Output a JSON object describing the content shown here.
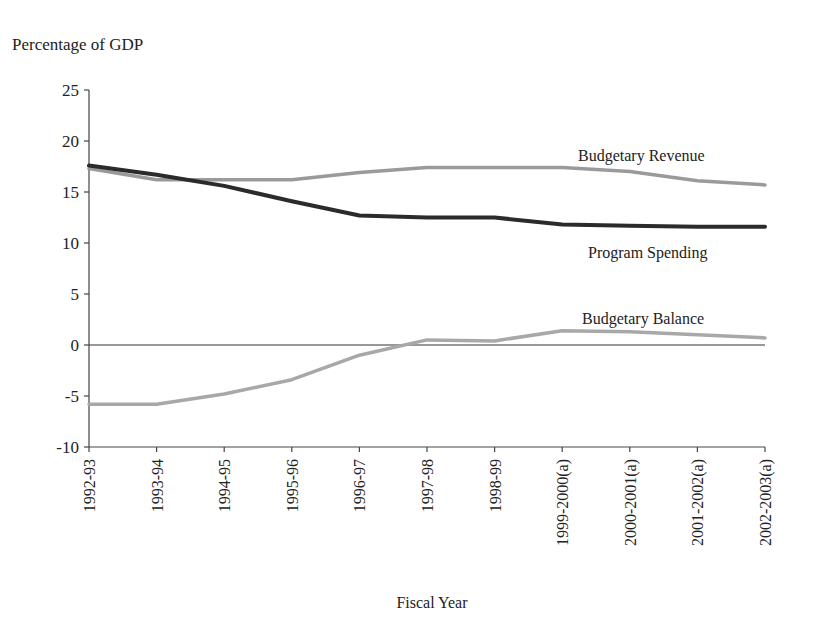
{
  "chart_data": {
    "type": "line",
    "title": "",
    "ylabel": "Percentage of GDP",
    "xlabel": "Fiscal Year",
    "ylim": [
      -10,
      25
    ],
    "yticks": [
      25,
      20,
      15,
      10,
      5,
      0,
      -5,
      -10
    ],
    "grid": false,
    "legend_position": "inline labels",
    "categories": [
      "1992-93",
      "1993-94",
      "1994-95",
      "1995-96",
      "1996-97",
      "1997-98",
      "1998-99",
      "1999-2000(a)",
      "2000-2001(a)",
      "2001-2002(a)",
      "2002-2003(a)"
    ],
    "series": [
      {
        "name": "Budgetary Revenue",
        "color": "#9a9a9a",
        "values": [
          17.3,
          16.2,
          16.2,
          16.2,
          16.9,
          17.4,
          17.4,
          17.4,
          17.0,
          16.1,
          15.7
        ]
      },
      {
        "name": "Program Spending",
        "color": "#2b2b2b",
        "values": [
          17.6,
          16.7,
          15.6,
          14.1,
          12.7,
          12.5,
          12.5,
          11.8,
          11.7,
          11.6,
          11.6
        ]
      },
      {
        "name": "Budgetary Balance",
        "color": "#a8a8a8",
        "values": [
          -5.8,
          -5.8,
          -4.8,
          -3.4,
          -1.0,
          0.5,
          0.4,
          1.4,
          1.3,
          1.0,
          0.7
        ]
      }
    ],
    "annotations": [
      {
        "text": "Budgetary Revenue",
        "series": 0
      },
      {
        "text": "Program Spending",
        "series": 1
      },
      {
        "text": "Budgetary Balance",
        "series": 2
      }
    ]
  }
}
